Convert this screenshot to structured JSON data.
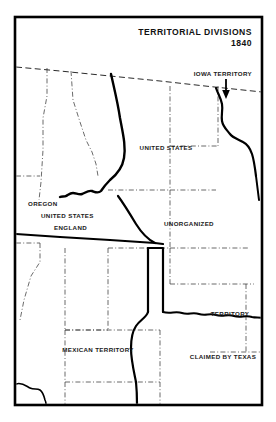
{
  "figure": {
    "kind": "historical-map",
    "width": 276,
    "height": 422,
    "background_color": "#ffffff",
    "frame_color": "#000000"
  },
  "title": {
    "line1": "TERRITORIAL DIVISIONS",
    "line2": "1840",
    "align": "right"
  },
  "labels": {
    "iowa_territory": "IOWA TERRITORY",
    "united_states": "UNITED STATES",
    "oregon": "OREGON",
    "oregon_united_states": "UNITED STATES",
    "oregon_england": "ENGLAND",
    "unorganized": "UNORGANIZED",
    "territory": "TERRITORY",
    "mexican_territory": "MEXICAN TERRITORY",
    "claimed_by_texas": "CLAIMED BY TEXAS"
  },
  "legend_semantics": {
    "solid_thick": "historical territorial boundary",
    "dashed": "international / treaty boundary",
    "dash_dot": "modern state boundary reference"
  },
  "colors": {
    "ink": "#000000",
    "label_ink": "#1a1a1a",
    "paper": "#ffffff"
  }
}
